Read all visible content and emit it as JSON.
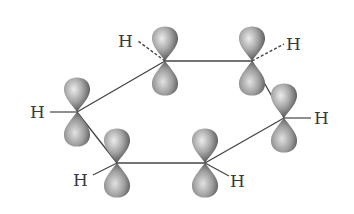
{
  "diagram": {
    "type": "molecular orbital diagram",
    "atom_label": "H",
    "colors": {
      "background": "#ffffff",
      "line": "#444444",
      "orbital_light": "#e6e6e6",
      "orbital_dark": "#4a4a4a",
      "text": "#3a3a3a"
    },
    "carbons": [
      {
        "id": "C1",
        "x": 77,
        "y": 112,
        "h": {
          "label": "H",
          "x": 30,
          "y": 118,
          "bond": "solid"
        }
      },
      {
        "id": "C2",
        "x": 165,
        "y": 61,
        "h": {
          "label": "H",
          "x": 118,
          "y": 47,
          "bond": "dashed"
        }
      },
      {
        "id": "C3",
        "x": 252,
        "y": 61,
        "h": {
          "label": "H",
          "x": 286,
          "y": 50,
          "bond": "dashed"
        }
      },
      {
        "id": "C4",
        "x": 284,
        "y": 118,
        "h": {
          "label": "H",
          "x": 315,
          "y": 124,
          "bond": "solid"
        }
      },
      {
        "id": "C5",
        "x": 205,
        "y": 163,
        "h": {
          "label": "H",
          "x": 230,
          "y": 186,
          "bond": "solid"
        }
      },
      {
        "id": "C6",
        "x": 117,
        "y": 163,
        "h": {
          "label": "H",
          "x": 72,
          "y": 186,
          "bond": "solid"
        }
      }
    ],
    "h_labels": [
      "H",
      "H",
      "H",
      "H",
      "H",
      "H"
    ]
  }
}
